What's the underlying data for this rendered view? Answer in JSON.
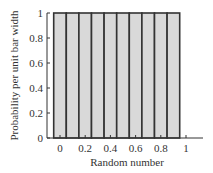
{
  "chart_data": {
    "type": "bar",
    "title": "",
    "xlabel": "Random number",
    "ylabel": "Probability per unit bar width",
    "categories": [
      "0",
      "0.1",
      "0.2",
      "0.3",
      "0.4",
      "0.5",
      "0.6",
      "0.7",
      "0.8",
      "0.9"
    ],
    "values": [
      1,
      1,
      1,
      1,
      1,
      1,
      1,
      1,
      1,
      1
    ],
    "bar_width": 0.1,
    "xticks": [
      "0",
      "0.2",
      "0.4",
      "0.6",
      "0.8",
      "1"
    ],
    "yticks": [
      "0",
      "0.2",
      "0.4",
      "0.6",
      "0.8",
      "1"
    ],
    "ylim": [
      0,
      1
    ],
    "xlim": [
      -0.05,
      1.15
    ],
    "grid": false,
    "legend": null,
    "colors": {
      "bar_fill": "#d9d9d9",
      "bar_edge": "#333333",
      "axis": "#333333"
    }
  }
}
